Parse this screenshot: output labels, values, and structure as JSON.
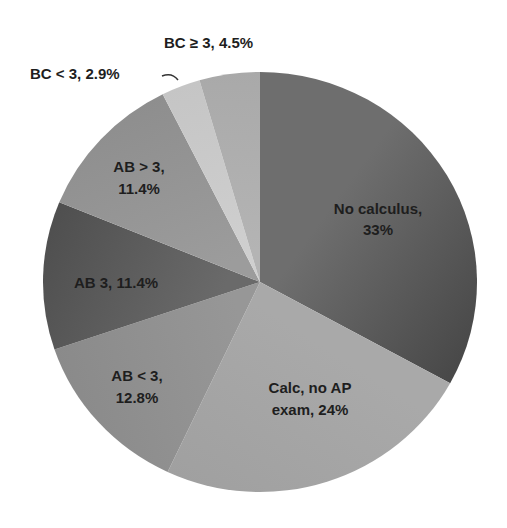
{
  "chart_data": {
    "type": "pie",
    "title": "",
    "start_angle_deg": 0,
    "direction": "clockwise",
    "slices": [
      {
        "label": "No calculus",
        "value": 33.0,
        "display": [
          "No calculus,",
          "33%"
        ],
        "color": "#6e6e6e",
        "color_dark": "#484848"
      },
      {
        "label": "Calc, no AP exam",
        "value": 24.0,
        "display": [
          "Calc, no AP",
          "exam, 24%"
        ],
        "color": "#a9a9a9",
        "color_dark": "#a0a0a0"
      },
      {
        "label": "AB < 3",
        "value": 12.8,
        "display": [
          "AB < 3,",
          "12.8%"
        ],
        "color": "#979797",
        "color_dark": "#8a8a8a"
      },
      {
        "label": "AB 3",
        "value": 11.4,
        "display": [
          "AB 3, 11.4%"
        ],
        "color": "#6a6a6a",
        "color_dark": "#4f4f4f"
      },
      {
        "label": "AB > 3",
        "value": 11.4,
        "display": [
          "AB > 3,",
          "11.4%"
        ],
        "color": "#9c9c9c",
        "color_dark": "#8e8e8e"
      },
      {
        "label": "BC < 3",
        "value": 2.9,
        "display": [
          "BC < 3, 2.9%"
        ],
        "color": "#cfcfcf",
        "color_dark": "#c5c5c5"
      },
      {
        "label": "BC ≥ 3",
        "value": 4.5,
        "display": [
          "BC ≥ 3, 4.5%"
        ],
        "color": "#b4b4b4",
        "color_dark": "#a9a9a9"
      }
    ],
    "legend": "none",
    "data_labels": "category, percentage"
  }
}
